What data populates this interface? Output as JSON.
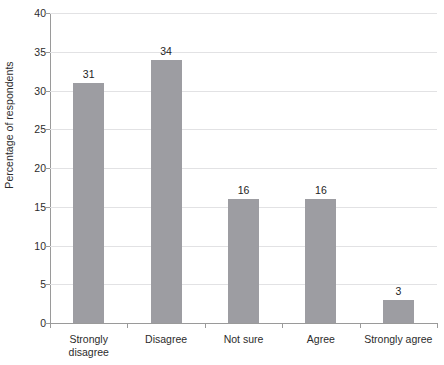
{
  "chart_data": {
    "type": "bar",
    "title": "",
    "subtitle": "",
    "xlabel": "",
    "ylabel": "Percentage of respondents",
    "categories": [
      "Strongly disagree",
      "Disagree",
      "Not sure",
      "Agree",
      "Strongly agree"
    ],
    "category_lines": [
      [
        "Strongly",
        "disagree"
      ],
      [
        "Disagree"
      ],
      [
        "Not sure"
      ],
      [
        "Agree"
      ],
      [
        "Strongly agree"
      ]
    ],
    "values": [
      31,
      34,
      16,
      16,
      3
    ],
    "value_labels": [
      "31",
      "34",
      "16",
      "16",
      "3"
    ],
    "ylim": [
      0,
      40
    ],
    "ytick_labels": [
      "0",
      "5",
      "10",
      "15",
      "20",
      "25",
      "30",
      "35",
      "40"
    ],
    "ytick_values": [
      0,
      5,
      10,
      15,
      20,
      25,
      30,
      35,
      40
    ],
    "grid": true,
    "grid_axis": "y",
    "legend": "none",
    "bar_color": "#9d9da2",
    "gridline_color": "#e2e2e4",
    "axis_color": "#9a9a9a",
    "text_color": "#2c2c2c",
    "background": "#ffffff"
  }
}
